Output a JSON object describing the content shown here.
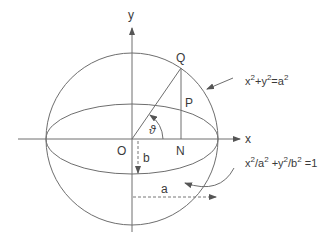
{
  "diagram": {
    "axes": {
      "x_label": "x",
      "y_label": "y"
    },
    "points": {
      "origin": "O",
      "Q": "Q",
      "P": "P",
      "N": "N"
    },
    "angle_label": "ϑ",
    "semi_axes": {
      "minor": "b",
      "major": "a"
    },
    "equations": {
      "circle": {
        "text": "x²+y²=a²",
        "parts": [
          "x",
          "2",
          "+y",
          "2",
          "=a",
          "2"
        ]
      },
      "ellipse": {
        "text": "x²/a² +y²/b² =1",
        "parts": [
          "x",
          "2",
          "/a",
          "2",
          " +y",
          "2",
          "/b",
          "2",
          " =1"
        ]
      }
    },
    "colors": {
      "stroke": "#6e6e6e",
      "text": "#3a3a3a",
      "background": "#ffffff"
    }
  }
}
